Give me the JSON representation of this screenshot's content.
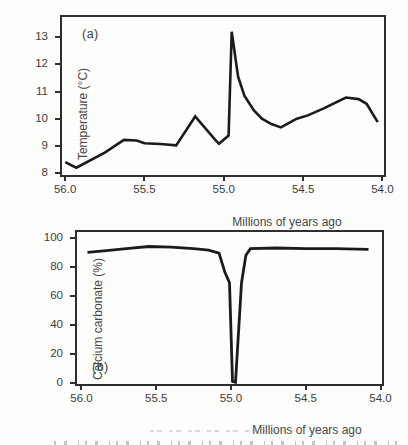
{
  "figure": {
    "background": "#fdfdfc",
    "frame_color": "#2e2e2e",
    "text_color": "#3c3c3c"
  },
  "chart_data": [
    {
      "id": "chart-a",
      "type": "line",
      "panel_label": "(a)",
      "ylabel": "Temperature (°C)",
      "xlabel": "Millions of years ago",
      "x_axis_reversed": true,
      "x_range": [
        56.02,
        53.99
      ],
      "y_range": [
        7.93,
        13.74
      ],
      "x_ticks": [
        56.0,
        55.5,
        55.0,
        54.5,
        54.0
      ],
      "x_tick_labels": [
        "56.0",
        "55.5",
        "55.0",
        "54.5",
        "54.0"
      ],
      "y_ticks": [
        8,
        9,
        10,
        11,
        12,
        13
      ],
      "y_tick_labels": [
        "8",
        "9",
        "10",
        "11",
        "12",
        "13"
      ],
      "grid": false,
      "legend": false,
      "line_color": "#1b1b1b",
      "line_width": 2.6,
      "points": [
        [
          56.0,
          8.4
        ],
        [
          55.93,
          8.2
        ],
        [
          55.75,
          8.75
        ],
        [
          55.63,
          9.22
        ],
        [
          55.55,
          9.2
        ],
        [
          55.5,
          9.1
        ],
        [
          55.4,
          9.07
        ],
        [
          55.3,
          9.02
        ],
        [
          55.18,
          10.08
        ],
        [
          55.05,
          9.19
        ],
        [
          55.03,
          9.08
        ],
        [
          54.97,
          9.38
        ],
        [
          54.95,
          13.2
        ],
        [
          54.91,
          11.55
        ],
        [
          54.87,
          10.85
        ],
        [
          54.81,
          10.3
        ],
        [
          54.76,
          10.0
        ],
        [
          54.7,
          9.8
        ],
        [
          54.64,
          9.68
        ],
        [
          54.54,
          10.0
        ],
        [
          54.47,
          10.12
        ],
        [
          54.37,
          10.38
        ],
        [
          54.23,
          10.78
        ],
        [
          54.15,
          10.72
        ],
        [
          54.1,
          10.55
        ],
        [
          54.03,
          9.87
        ]
      ]
    },
    {
      "id": "chart-b",
      "type": "line",
      "panel_label": "(b)",
      "ylabel": "Calcium carbonate (%)",
      "xlabel": "Millions of years ago",
      "x_axis_reversed": true,
      "x_range": [
        56.03,
        53.99
      ],
      "y_range": [
        -0.7,
        104.0
      ],
      "x_ticks": [
        56.0,
        55.5,
        55.0,
        54.5,
        54.0
      ],
      "x_tick_labels": [
        "56.0",
        "55.5",
        "55.0",
        "54.5",
        "54.0"
      ],
      "y_ticks": [
        0,
        20,
        40,
        60,
        80,
        100
      ],
      "y_tick_labels": [
        "0",
        "20",
        "40",
        "60",
        "80",
        "100"
      ],
      "grid": false,
      "legend": false,
      "line_color": "#1b1b1b",
      "line_width": 2.8,
      "points": [
        [
          55.96,
          90.0
        ],
        [
          55.85,
          91.0
        ],
        [
          55.7,
          92.5
        ],
        [
          55.55,
          94.0
        ],
        [
          55.4,
          93.5
        ],
        [
          55.25,
          92.5
        ],
        [
          55.15,
          91.5
        ],
        [
          55.08,
          89.5
        ],
        [
          55.04,
          76.0
        ],
        [
          55.01,
          69.0
        ],
        [
          54.99,
          1.0
        ],
        [
          54.97,
          0.5
        ],
        [
          54.93,
          69.0
        ],
        [
          54.9,
          88.0
        ],
        [
          54.87,
          92.5
        ],
        [
          54.7,
          93.0
        ],
        [
          54.5,
          92.5
        ],
        [
          54.3,
          92.5
        ],
        [
          54.08,
          92.0
        ]
      ]
    }
  ]
}
